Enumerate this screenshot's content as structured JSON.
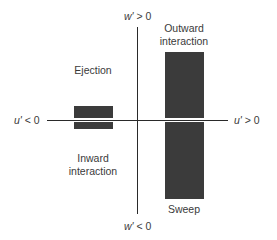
{
  "diagram": {
    "axes": {
      "horizontal": {
        "negative_label_var": "u'",
        "negative_label_rel": "< 0",
        "positive_label_var": "u'",
        "positive_label_rel": "> 0"
      },
      "vertical": {
        "positive_label_var": "w'",
        "positive_label_rel": "> 0",
        "negative_label_var": "w'",
        "negative_label_rel": "< 0"
      }
    },
    "quadrants": {
      "top_left": "Ejection",
      "top_right_line1": "Outward",
      "top_right_line2": "interaction",
      "bottom_left_line1": "Inward",
      "bottom_left_line2": "interaction",
      "bottom_right": "Sweep"
    },
    "bars": [
      {
        "name": "ejection-inward-bar",
        "quadrant_side": "left",
        "extent_up": 14,
        "extent_down": 9
      },
      {
        "name": "outward-sweep-bar",
        "quadrant_side": "right",
        "extent_up": 68,
        "extent_down": 79
      }
    ],
    "colors": {
      "bar": "#3b3b3b",
      "axis": "#2a2a2a",
      "text": "#3a3a3a",
      "background": "#ffffff"
    }
  }
}
